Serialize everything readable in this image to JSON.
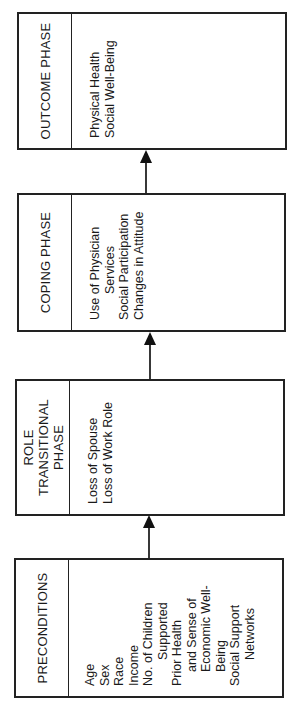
{
  "diagram": {
    "orientation": "rotated-90-ccw",
    "line_color": "#222222",
    "boxes": [
      {
        "id": "preconditions",
        "title": "PRECONDITIONS",
        "items": [
          {
            "text": "Age"
          },
          {
            "text": "Sex"
          },
          {
            "text": "Race"
          },
          {
            "text": "Income"
          },
          {
            "text": "No. of Children"
          },
          {
            "text": "Supported",
            "indent": true
          },
          {
            "text": "Prior Health"
          },
          {
            "text": "and Sense of",
            "indent": true
          },
          {
            "text": "Economic Well-",
            "indent": true
          },
          {
            "text": "Being",
            "indent": true
          },
          {
            "text": "Social Support"
          },
          {
            "text": "Networks",
            "indent": true
          }
        ]
      },
      {
        "id": "role-transitional",
        "title_lines": [
          "ROLE",
          "TRANSITIONAL",
          "PHASE"
        ],
        "items": [
          {
            "text": "Loss of Spouse"
          },
          {
            "text": "Loss of Work Role"
          }
        ]
      },
      {
        "id": "coping",
        "title": "COPING PHASE",
        "items": [
          {
            "text": "Use of Physician"
          },
          {
            "text": "Services",
            "indent": true
          },
          {
            "text": "Social Participation"
          },
          {
            "text": "Changes in Attitude"
          }
        ]
      },
      {
        "id": "outcome",
        "title": "OUTCOME PHASE",
        "items": [
          {
            "text": "Physical Health"
          },
          {
            "text": "Social Well-Being"
          }
        ]
      }
    ],
    "arrows": [
      {
        "from": "preconditions",
        "to": "role-transitional"
      },
      {
        "from": "role-transitional",
        "to": "coping"
      },
      {
        "from": "coping",
        "to": "outcome"
      }
    ]
  }
}
